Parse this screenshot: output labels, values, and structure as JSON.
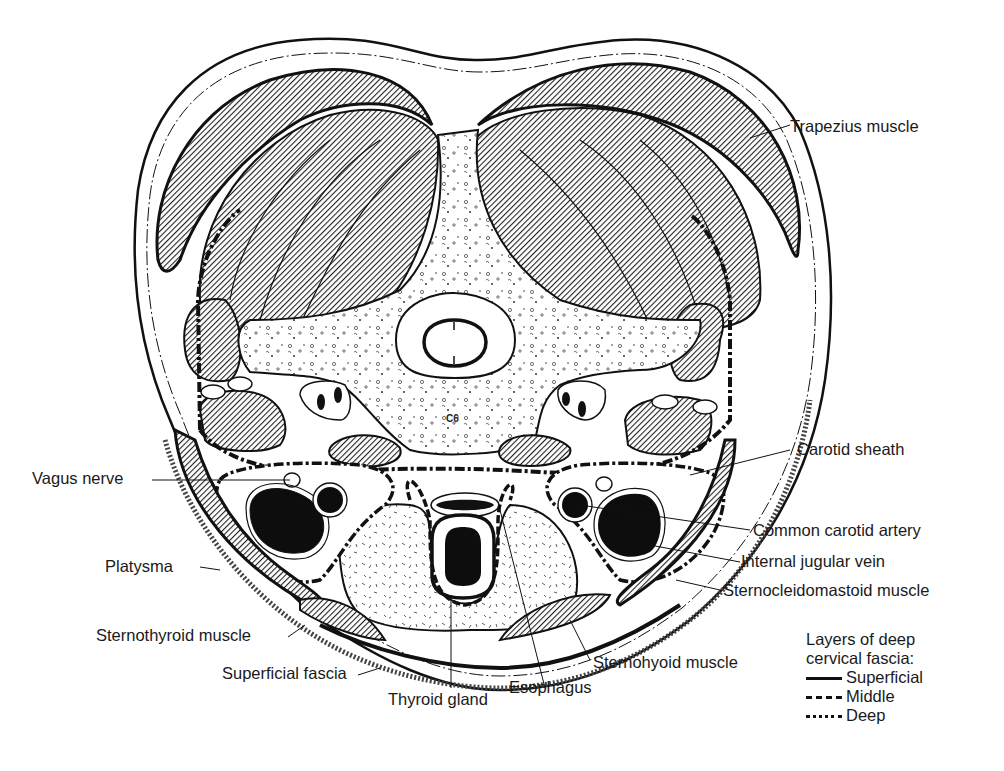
{
  "figure": {
    "vertebra_label": "C6",
    "colors": {
      "ink": "#111111",
      "muscle_hatch_bg": "#9a9a9a",
      "vessel_fill": "#0d0d0d",
      "paper": "#ffffff"
    }
  },
  "labels": {
    "trapezius": "Trapezius muscle",
    "carotid_sheath": "Carotid sheath",
    "vagus_nerve": "Vagus nerve",
    "common_carotid": "Common carotid artery",
    "internal_jugular": "Internal jugular vein",
    "platysma": "Platysma",
    "sternocleidomastoid": "Sternocleidomastoid muscle",
    "sternothyroid": "Sternothyroid muscle",
    "superficial_fascia": "Superficial fascia",
    "sternohyoid": "Sternohyoid muscle",
    "thyroid_gland": "Thyroid gland",
    "esophagus": "Esophagus"
  },
  "legend": {
    "title_line1": "Layers of deep",
    "title_line2": "cervical fascia:",
    "items": [
      {
        "style": "solid",
        "label": "Superficial"
      },
      {
        "style": "dashed",
        "label": "Middle"
      },
      {
        "style": "dash-dot",
        "label": "Deep"
      }
    ]
  }
}
